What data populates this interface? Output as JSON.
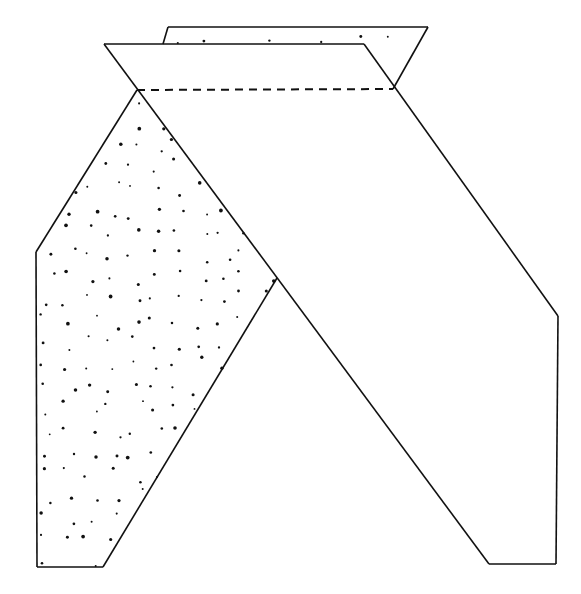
{
  "diagram": {
    "type": "paper-folding-diagram",
    "width": 581,
    "height": 594,
    "colors": {
      "line": "#111111",
      "background": "#ffffff",
      "stipple": "#111111"
    },
    "back_flap": {
      "label": "back-layer-strip",
      "points": [
        [
          168,
          27
        ],
        [
          428,
          27
        ],
        [
          393,
          89
        ],
        [
          364,
          44
        ],
        [
          163,
          44
        ]
      ],
      "stippled": true
    },
    "left_panel": {
      "label": "left-stippled-leg",
      "points": [
        [
          137,
          90
        ],
        [
          277,
          278
        ],
        [
          103,
          567
        ],
        [
          37,
          567
        ],
        [
          36,
          252
        ]
      ],
      "stippled": true
    },
    "front_band": {
      "label": "front-top-band",
      "points": [
        [
          104,
          44
        ],
        [
          364,
          44
        ],
        [
          393,
          89
        ],
        [
          137,
          90
        ]
      ]
    },
    "right_panel": {
      "label": "right-white-leg",
      "outline": [
        [
          393,
          89
        ],
        [
          558,
          316
        ],
        [
          556,
          564
        ],
        [
          489,
          564
        ],
        [
          137,
          90
        ]
      ]
    },
    "edges": [
      [
        [
          104,
          44
        ],
        [
          364,
          44
        ]
      ],
      [
        [
          364,
          44
        ],
        [
          558,
          316
        ]
      ],
      [
        [
          558,
          316
        ],
        [
          556,
          564
        ]
      ],
      [
        [
          556,
          564
        ],
        [
          489,
          564
        ]
      ],
      [
        [
          489,
          564
        ],
        [
          104,
          44
        ]
      ],
      [
        [
          168,
          27
        ],
        [
          428,
          27
        ]
      ],
      [
        [
          168,
          27
        ],
        [
          163,
          44
        ]
      ],
      [
        [
          428,
          27
        ],
        [
          393,
          89
        ]
      ],
      [
        [
          137,
          90
        ],
        [
          36,
          252
        ]
      ],
      [
        [
          36,
          252
        ],
        [
          37,
          567
        ]
      ],
      [
        [
          37,
          567
        ],
        [
          103,
          567
        ]
      ],
      [
        [
          103,
          567
        ],
        [
          277,
          278
        ]
      ]
    ],
    "fold_line": {
      "label": "valley-fold-dashed",
      "from": [
        137,
        90
      ],
      "to": [
        393,
        89
      ]
    },
    "stipple": {
      "spacing": 22,
      "jitter": 8,
      "min_r": 0.9,
      "max_r": 1.9,
      "seed": 7
    }
  }
}
